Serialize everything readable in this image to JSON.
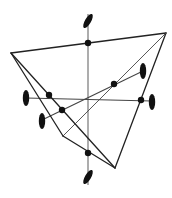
{
  "diagram": {
    "type": "geometric-polyhedron-projection",
    "colors": {
      "background": "#ffffff",
      "edge": "#222222",
      "thin_edge": "#444444",
      "axis": "#8a8a8a",
      "node": "#111111"
    },
    "vertices": {
      "left": [
        11,
        53
      ],
      "top_right": [
        166,
        33
      ],
      "bottom": [
        115,
        168
      ],
      "inner": [
        63,
        136
      ]
    },
    "edges": [
      {
        "from": "left",
        "to": "top_right",
        "style": "bold"
      },
      {
        "from": "top_right",
        "to": "bottom",
        "style": "bold"
      },
      {
        "from": "left",
        "to": "bottom",
        "style": "bold"
      },
      {
        "from": "left",
        "to": "inner",
        "style": "bold"
      },
      {
        "from": "inner",
        "to": "bottom",
        "style": "bold"
      },
      {
        "from": "top_right",
        "to": "inner",
        "style": "thin"
      }
    ],
    "axes": [
      {
        "name": "vertical-axis",
        "from": [
          88,
          14
        ],
        "to": [
          88,
          185
        ]
      },
      {
        "name": "horizontal-axis",
        "from": [
          26,
          98
        ],
        "to": [
          152,
          101
        ]
      },
      {
        "name": "diagonal-axis",
        "from": [
          42,
          120
        ],
        "to": [
          143,
          71
        ]
      }
    ],
    "nodes": [
      {
        "name": "node-top-edge",
        "at": [
          88,
          43
        ]
      },
      {
        "name": "node-left-upper",
        "at": [
          49,
          95
        ]
      },
      {
        "name": "node-left-lower",
        "at": [
          62,
          110
        ]
      },
      {
        "name": "node-right-upper",
        "at": [
          114,
          84
        ]
      },
      {
        "name": "node-right-lower",
        "at": [
          141,
          100
        ]
      },
      {
        "name": "node-bottom",
        "at": [
          88,
          153
        ]
      }
    ],
    "ellipse_markers": [
      {
        "name": "marker-top",
        "cx": 88,
        "cy": 21,
        "rx": 3,
        "ry": 8,
        "rotate": 30
      },
      {
        "name": "marker-bottom",
        "cx": 88,
        "cy": 177,
        "rx": 3,
        "ry": 8,
        "rotate": 30
      },
      {
        "name": "marker-left",
        "cx": 26,
        "cy": 98,
        "rx": 3.2,
        "ry": 8,
        "rotate": 0
      },
      {
        "name": "marker-left-lower",
        "cx": 42,
        "cy": 121,
        "rx": 3.2,
        "ry": 8,
        "rotate": 0
      },
      {
        "name": "marker-right-upper",
        "cx": 143,
        "cy": 71,
        "rx": 3.2,
        "ry": 8,
        "rotate": 0
      },
      {
        "name": "marker-right-lower",
        "cx": 152,
        "cy": 102,
        "rx": 3.2,
        "ry": 8,
        "rotate": 0
      }
    ]
  }
}
